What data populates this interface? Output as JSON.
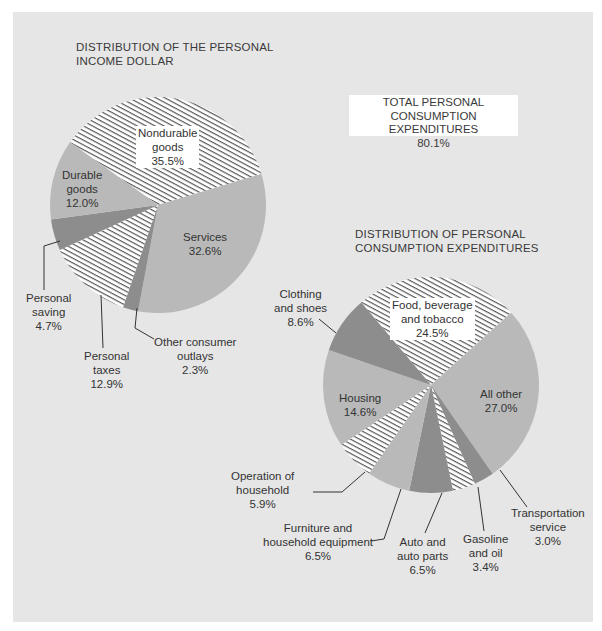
{
  "chart_data": [
    {
      "type": "pie",
      "title": "DISTRIBUTION OF THE PERSONAL INCOME DOLLAR",
      "title_lines": [
        "DISTRIBUTION OF THE PERSONAL",
        "INCOME DOLLAR"
      ],
      "center": [
        158,
        205
      ],
      "radius": 108,
      "start_bearing_deg": -54.5,
      "slices": [
        {
          "label": "Nondurable goods",
          "lines": [
            "Nondurable",
            "goods",
            "35.5%"
          ],
          "value": 35.5,
          "fill": "hatch"
        },
        {
          "label": "Services",
          "lines": [
            "Services",
            "32.6%"
          ],
          "value": 32.6,
          "fill": "light"
        },
        {
          "label": "Other consumer outlays",
          "lines": [
            "Other consumer",
            "outlays",
            "2.3%"
          ],
          "value": 2.3,
          "fill": "dark"
        },
        {
          "label": "Personal taxes",
          "lines": [
            "Personal",
            "taxes",
            "12.9%"
          ],
          "value": 12.9,
          "fill": "hatch"
        },
        {
          "label": "Personal saving",
          "lines": [
            "Personal",
            "saving",
            "4.7%"
          ],
          "value": 4.7,
          "fill": "dark"
        },
        {
          "label": "Durable goods",
          "lines": [
            "Durable",
            "goods",
            "12.0%"
          ],
          "value": 12.0,
          "fill": "light"
        }
      ]
    },
    {
      "type": "pie",
      "title": "DISTRIBUTION OF PERSONAL CONSUMPTION EXPENDITURES",
      "title_lines": [
        "DISTRIBUTION OF PERSONAL",
        "CONSUMPTION EXPENDITURES"
      ],
      "center": [
        431,
        385
      ],
      "radius": 108,
      "start_bearing_deg": -40.2,
      "slices": [
        {
          "label": "Food, beverage and tobacco",
          "lines": [
            "Food, beverage",
            "and tobacco",
            "24.5%"
          ],
          "value": 24.5,
          "fill": "hatch"
        },
        {
          "label": "All other",
          "lines": [
            "All other",
            "27.0%"
          ],
          "value": 27.0,
          "fill": "light"
        },
        {
          "label": "Transportation service",
          "lines": [
            "Transportation",
            "service",
            "3.0%"
          ],
          "value": 3.0,
          "fill": "dark"
        },
        {
          "label": "Gasoline and oil",
          "lines": [
            "Gasoline",
            "and oil",
            "3.4%"
          ],
          "value": 3.4,
          "fill": "hatch"
        },
        {
          "label": "Auto and auto parts",
          "lines": [
            "Auto and",
            "auto parts",
            "6.5%"
          ],
          "value": 6.5,
          "fill": "dark"
        },
        {
          "label": "Furniture and household equipment",
          "lines": [
            "Furniture and",
            "household equipment",
            "6.5%"
          ],
          "value": 6.5,
          "fill": "light"
        },
        {
          "label": "Operation of household",
          "lines": [
            "Operation of",
            "household",
            "5.9%"
          ],
          "value": 5.9,
          "fill": "hatch"
        },
        {
          "label": "Housing",
          "lines": [
            "Housing",
            "14.6%"
          ],
          "value": 14.6,
          "fill": "light"
        },
        {
          "label": "Clothing and shoes",
          "lines": [
            "Clothing",
            "and shoes",
            "8.6%"
          ],
          "value": 8.6,
          "fill": "dark"
        }
      ]
    }
  ],
  "callout": {
    "lines": [
      "TOTAL PERSONAL",
      "CONSUMPTION EXPENDITURES",
      "80.1%"
    ],
    "label": "TOTAL PERSONAL CONSUMPTION EXPENDITURES",
    "value": "80.1%"
  },
  "colors": {
    "page": "#ffffff",
    "panel": "#e6e6e6",
    "light": "#b9b9b9",
    "dark": "#8d8d8d",
    "hatch_bg": "#ffffff",
    "hatch_line": "#4a4a4a",
    "text": "#333333",
    "leader": "#333333"
  }
}
